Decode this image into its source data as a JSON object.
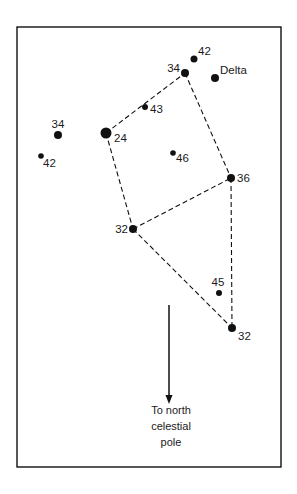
{
  "diagram": {
    "colors": {
      "ink": "#111111",
      "background": "#ffffff"
    },
    "frame": {
      "x": 17,
      "y": 27,
      "width": 264,
      "height": 440
    },
    "stars": [
      {
        "id": "s42_top",
        "label": "42",
        "x": 194,
        "y": 59,
        "r": 3.5,
        "lx": 198,
        "ly": 55,
        "anchor": "start"
      },
      {
        "id": "s34_top",
        "label": "34",
        "x": 185,
        "y": 73,
        "r": 4.0,
        "lx": 180,
        "ly": 72,
        "anchor": "end"
      },
      {
        "id": "delta",
        "label": "Delta",
        "x": 215,
        "y": 78,
        "r": 4.0,
        "lx": 220,
        "ly": 74,
        "anchor": "start"
      },
      {
        "id": "s43",
        "label": "43",
        "x": 145,
        "y": 107,
        "r": 3.0,
        "lx": 150,
        "ly": 113,
        "anchor": "start"
      },
      {
        "id": "s24",
        "label": "24",
        "x": 106,
        "y": 133,
        "r": 5.5,
        "lx": 114,
        "ly": 142,
        "anchor": "start"
      },
      {
        "id": "s34_left",
        "label": "34",
        "x": 58,
        "y": 135,
        "r": 4.0,
        "lx": 58,
        "ly": 128,
        "anchor": "middle"
      },
      {
        "id": "s42_left",
        "label": "42",
        "x": 41,
        "y": 156,
        "r": 2.8,
        "lx": 43,
        "ly": 167,
        "anchor": "start"
      },
      {
        "id": "s46",
        "label": "46",
        "x": 173,
        "y": 153,
        "r": 2.8,
        "lx": 176,
        "ly": 162,
        "anchor": "start"
      },
      {
        "id": "s36",
        "label": "36",
        "x": 231,
        "y": 178,
        "r": 4.0,
        "lx": 237,
        "ly": 182,
        "anchor": "start"
      },
      {
        "id": "s32_mid",
        "label": "32",
        "x": 133,
        "y": 229,
        "r": 4.0,
        "lx": 128,
        "ly": 233,
        "anchor": "end"
      },
      {
        "id": "s45",
        "label": "45",
        "x": 219,
        "y": 293,
        "r": 3.0,
        "lx": 218,
        "ly": 286,
        "anchor": "middle"
      },
      {
        "id": "s32_bot",
        "label": "32",
        "x": 232,
        "y": 328,
        "r": 4.0,
        "lx": 238,
        "ly": 340,
        "anchor": "start"
      }
    ],
    "dashed_lines": [
      {
        "from": "s24",
        "to": "s34_top"
      },
      {
        "from": "s34_top",
        "to": "s36"
      },
      {
        "from": "s24",
        "to": "s32_mid"
      },
      {
        "from": "s32_mid",
        "to": "s36"
      },
      {
        "from": "s36",
        "to": "s32_bot"
      },
      {
        "from": "s32_mid",
        "to": "s32_bot"
      }
    ],
    "arrow": {
      "x": 169,
      "y1": 305,
      "y2": 404
    },
    "caption": {
      "x": 171,
      "lines": [
        "To north",
        "celestial",
        "pole"
      ],
      "y": [
        414,
        430,
        446
      ]
    }
  }
}
